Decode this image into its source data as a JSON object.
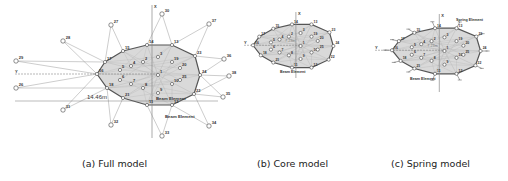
{
  "captions": {
    "full": "(a) Full model",
    "core": "(b) Core model",
    "spring": "(c) Spring model"
  },
  "colors": {
    "hull_fill": "#d9d9d9",
    "hull_stroke": "#555555",
    "line": "#9a9a9a",
    "node": "#ffffff",
    "text": "#333333"
  },
  "full_model": {
    "axis_x_label": "X",
    "axis_y_label": "Y",
    "dimension_label": "14.46m",
    "beam_label_1": "Beam Element",
    "beam_label_2": "Beam Element",
    "hull_nodes": [
      {
        "id": "16",
        "x": 97,
        "y": 74
      },
      {
        "id": "17",
        "x": 105,
        "y": 62
      },
      {
        "id": "15",
        "x": 123,
        "y": 51
      },
      {
        "id": "14",
        "x": 147,
        "y": 45
      },
      {
        "id": "13",
        "x": 172,
        "y": 45
      },
      {
        "id": "23",
        "x": 195,
        "y": 56
      },
      {
        "id": "24",
        "x": 200,
        "y": 75
      },
      {
        "id": "22",
        "x": 194,
        "y": 94
      },
      {
        "id": "12",
        "x": 172,
        "y": 105
      },
      {
        "id": "11",
        "x": 147,
        "y": 105
      },
      {
        "id": "21",
        "x": 123,
        "y": 98
      },
      {
        "id": "18",
        "x": 107,
        "y": 88
      }
    ],
    "inner_nodes": [
      {
        "id": "1",
        "x": 158,
        "y": 75
      },
      {
        "id": "2",
        "x": 143,
        "y": 62
      },
      {
        "id": "3",
        "x": 158,
        "y": 57
      },
      {
        "id": "4",
        "x": 131,
        "y": 66
      },
      {
        "id": "5",
        "x": 120,
        "y": 70
      },
      {
        "id": "6",
        "x": 120,
        "y": 80
      },
      {
        "id": "7",
        "x": 131,
        "y": 84
      },
      {
        "id": "8",
        "x": 143,
        "y": 88
      },
      {
        "id": "9",
        "x": 158,
        "y": 93
      },
      {
        "id": "10",
        "x": 172,
        "y": 84
      },
      {
        "id": "19",
        "x": 172,
        "y": 62
      },
      {
        "id": "20",
        "x": 180,
        "y": 68
      },
      {
        "id": "25",
        "x": 180,
        "y": 80
      }
    ],
    "outer_nodes": [
      {
        "id": "30",
        "x": 162,
        "y": 14
      },
      {
        "id": "27",
        "x": 111,
        "y": 25
      },
      {
        "id": "28",
        "x": 63,
        "y": 41
      },
      {
        "id": "29",
        "x": 16,
        "y": 61
      },
      {
        "id": "26",
        "x": 16,
        "y": 88
      },
      {
        "id": "31",
        "x": 63,
        "y": 110
      },
      {
        "id": "32",
        "x": 111,
        "y": 125
      },
      {
        "id": "33",
        "x": 162,
        "y": 136
      },
      {
        "id": "34",
        "x": 209,
        "y": 126
      },
      {
        "id": "35",
        "x": 223,
        "y": 97
      },
      {
        "id": "36",
        "x": 224,
        "y": 59
      },
      {
        "id": "37",
        "x": 209,
        "y": 24
      },
      {
        "id": "38",
        "x": 229,
        "y": 76
      }
    ]
  },
  "core_model": {
    "axis_x_label": "X",
    "axis_y_label": "Y",
    "dimension_label": "7.23m",
    "beam_label": "Beam Element"
  },
  "spring_model": {
    "axis_x_label": "X",
    "axis_y_label": "Y",
    "dimension_label": "7.23m",
    "beam_label": "Beam Element",
    "spring_label": "Spring Element"
  }
}
